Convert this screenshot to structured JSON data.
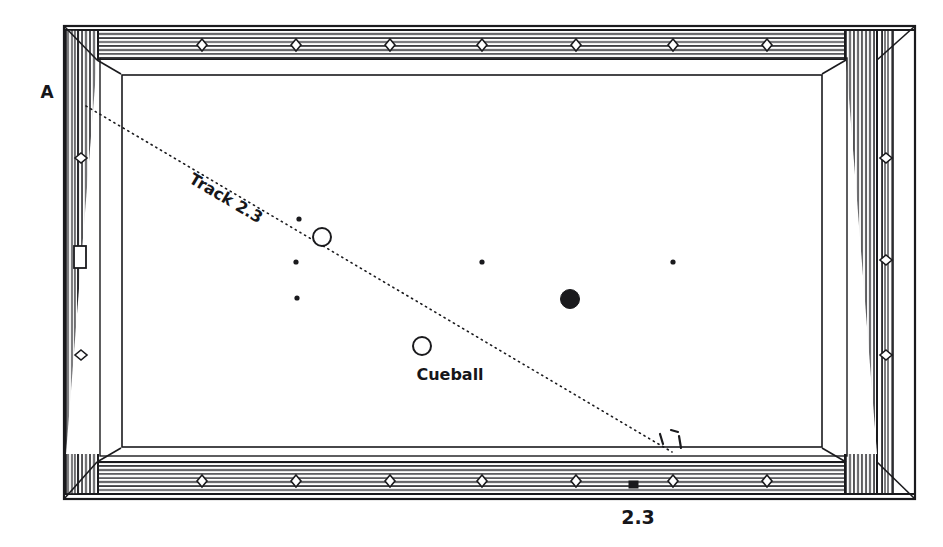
{
  "figure": {
    "type": "billiards-diagram",
    "title_visible": false,
    "background_color": "#ffffff",
    "ink_color": "#1a1a1d"
  },
  "labels": {
    "corner_label": "A",
    "track_label": "Track 2.3",
    "cueball_label": "Cueball",
    "bottom_label": "2.3"
  },
  "table": {
    "outer_frame": {
      "x": 64,
      "y": 26,
      "width": 851,
      "height": 473
    },
    "rail_thickness_top": 28,
    "rail_thickness_side": 38,
    "playing_surface": {
      "x": 100,
      "y": 58,
      "width": 777,
      "height": 396
    },
    "cloth_color": "#ffffff",
    "rail_wood_color": "#f4f4f4",
    "rail_grain_color": "#2a2a2e"
  },
  "diamonds": {
    "note": "sight diamonds on the rails",
    "top": [
      202,
      296,
      390,
      482,
      576,
      673,
      767
    ],
    "bottom": [
      202,
      296,
      390,
      482,
      576,
      673,
      767
    ],
    "left": [
      158,
      355
    ],
    "right": [
      158,
      260,
      355
    ]
  },
  "rail_markers": {
    "left_plate": {
      "x": 74,
      "y": 246,
      "width": 12,
      "height": 22
    },
    "bottom_dark_marker": {
      "x": 629,
      "y": 481,
      "width": 9,
      "height": 7
    }
  },
  "spots": [
    {
      "name": "spot-left-upper",
      "x": 299,
      "y": 219,
      "r": 2.6
    },
    {
      "name": "spot-left-middle",
      "x": 296,
      "y": 262,
      "r": 2.6
    },
    {
      "name": "spot-left-lower",
      "x": 297,
      "y": 298,
      "r": 2.6
    },
    {
      "name": "spot-center",
      "x": 482,
      "y": 262,
      "r": 2.6
    },
    {
      "name": "spot-right",
      "x": 673,
      "y": 262,
      "r": 2.6
    }
  ],
  "balls": [
    {
      "name": "object-ball",
      "kind": "open-circle",
      "x": 322,
      "y": 237,
      "r": 9,
      "fill": "#ffffff",
      "stroke": "#1a1a1d"
    },
    {
      "name": "cueball",
      "kind": "open-circle",
      "x": 422,
      "y": 346,
      "r": 9,
      "fill": "#ffffff",
      "stroke": "#1a1a1d",
      "label": "Cueball",
      "label_x": 450,
      "label_y": 380
    },
    {
      "name": "target-ball",
      "kind": "filled-circle",
      "x": 570,
      "y": 299,
      "r": 9.5,
      "fill": "#1a1a1d",
      "stroke": "#1a1a1d"
    }
  ],
  "track": {
    "name": "Track 2.3",
    "style": "dotted",
    "start": {
      "x": 86,
      "y": 106
    },
    "end": {
      "x": 672,
      "y": 452
    },
    "label": "Track 2.3",
    "label_x": 188,
    "label_y": 182,
    "label_rotation_deg": 30.5,
    "stroke": "#1a1a1d",
    "dash": "1.2 4.2",
    "width": 1.6
  },
  "annotations": {
    "arrival_ticks": [
      {
        "x1": 660,
        "y1": 434,
        "x2": 663,
        "y2": 444
      },
      {
        "x1": 671,
        "y1": 430,
        "x2": 678,
        "y2": 432
      },
      {
        "x1": 679,
        "y1": 436,
        "x2": 681,
        "y2": 448
      }
    ],
    "corner_label_x": 47,
    "corner_label_y": 98,
    "bottom_label_x": 638,
    "bottom_label_y": 524
  },
  "chart_data": {
    "type": "scatter",
    "xlabel": "",
    "ylabel": "",
    "categories": [
      "A",
      "Track 2.3",
      "Cueball",
      "2.3"
    ],
    "values": [
      2.3,
      2.3,
      2.3,
      2.3
    ]
  }
}
